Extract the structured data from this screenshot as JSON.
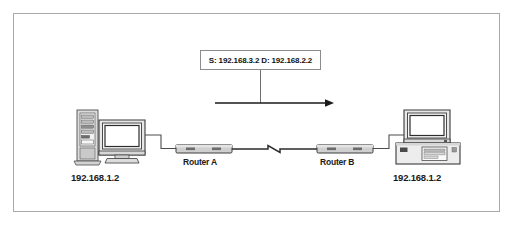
{
  "figure": {
    "type": "network-diagram",
    "background_color": "#ffffff",
    "border_color": "#a9a9a9",
    "line_color": "#4d4d4d",
    "text_color": "#111111",
    "device_fill": "#e3e3e3",
    "screen_fill": "#ffffff"
  },
  "packet_label": {
    "text": "S: 192.168.3.2   D: 192.168.2.2",
    "source_prefix": "S:",
    "source_ip": "192.168.3.2",
    "destination_prefix": "D:",
    "destination_ip": "192.168.2.2"
  },
  "flow": {
    "direction": "left-to-right",
    "arrowhead": "right"
  },
  "nodes": {
    "host_left": {
      "label": "192.168.1.2",
      "icon": "tower-pc-with-monitor"
    },
    "router_a": {
      "label": "Router A",
      "icon": "router"
    },
    "router_b": {
      "label": "Router B",
      "icon": "router"
    },
    "host_right": {
      "label": "192.168.1.2",
      "icon": "desktop-pc-with-monitor"
    }
  },
  "links": {
    "lan_left": "host-left-to-router-a",
    "wan": "router-a-to-router-b",
    "wan_style": "zigzag",
    "lan_right": "router-b-to-host-right"
  }
}
